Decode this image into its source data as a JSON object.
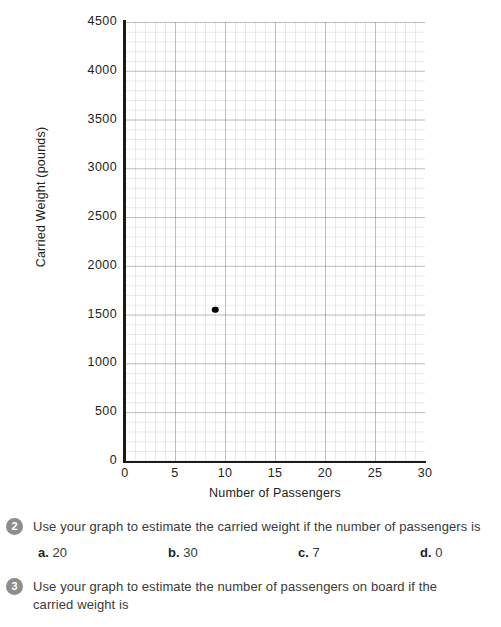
{
  "chart_data": {
    "type": "scatter",
    "title": "",
    "xlabel": "Number of Passengers",
    "ylabel": "Carried Weight (pounds)",
    "xlim": [
      0,
      30
    ],
    "ylim": [
      0,
      4500
    ],
    "xticks": [
      0,
      5,
      10,
      15,
      20,
      25,
      30
    ],
    "yticks": [
      0,
      500,
      1000,
      1500,
      2000,
      2500,
      3000,
      3500,
      4000,
      4500
    ],
    "xtick_labels": [
      "0",
      "5",
      "10",
      "15",
      "20",
      "25",
      "30"
    ],
    "ytick_labels": [
      "0",
      "500",
      "1000",
      "1500",
      "2000",
      "2500",
      "3000",
      "3500",
      "4000",
      "4500"
    ],
    "grid": true,
    "grid_minor_x": 1,
    "grid_minor_y": 100,
    "grid_major_x": 5,
    "grid_major_y": 500,
    "legend": false,
    "point_color": "#000000",
    "axis_color": "#1a1a1a",
    "points": [
      {
        "x": 9,
        "y": 1550
      }
    ]
  },
  "questions": [
    {
      "number": "2",
      "text": "Use your graph to estimate the carried weight if the number of passengers is",
      "options": [
        {
          "letter": "a.",
          "value": "20"
        },
        {
          "letter": "b.",
          "value": "30"
        },
        {
          "letter": "c.",
          "value": "7"
        },
        {
          "letter": "d.",
          "value": "0"
        }
      ]
    },
    {
      "number": "3",
      "text": "Use your graph to estimate the number of passengers on board if the carried weight is",
      "options": []
    }
  ]
}
